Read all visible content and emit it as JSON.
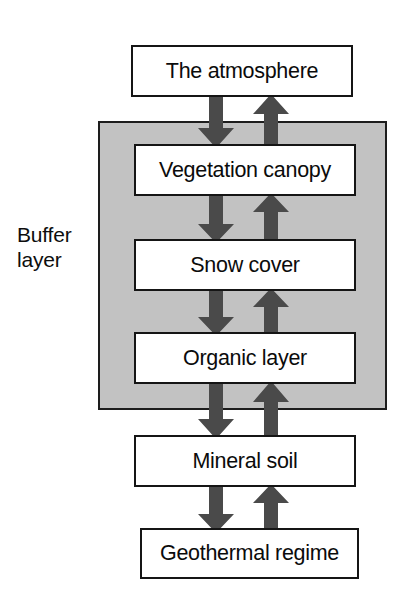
{
  "diagram": {
    "background_color": "#ffffff",
    "buffer_region": {
      "label_line1": "Buffer",
      "label_line2": "layer",
      "fill_color": "#c2c2c2",
      "border_color": "#1d1d1d"
    },
    "box_style": {
      "fill_color": "#ffffff",
      "border_color": "#151515"
    },
    "arrow_color": "#4a4a4a",
    "nodes": [
      {
        "id": "atmosphere",
        "label": "The atmosphere",
        "inside_buffer": false
      },
      {
        "id": "vegetation",
        "label": "Vegetation canopy",
        "inside_buffer": true
      },
      {
        "id": "snow",
        "label": "Snow cover",
        "inside_buffer": true
      },
      {
        "id": "organic",
        "label": "Organic layer",
        "inside_buffer": true
      },
      {
        "id": "mineral",
        "label": "Mineral soil",
        "inside_buffer": false
      },
      {
        "id": "geothermal",
        "label": "Geothermal regime",
        "inside_buffer": false
      }
    ],
    "connections": [
      {
        "from": "atmosphere",
        "to": "vegetation",
        "direction": "down"
      },
      {
        "from": "vegetation",
        "to": "atmosphere",
        "direction": "up"
      },
      {
        "from": "vegetation",
        "to": "snow",
        "direction": "down"
      },
      {
        "from": "snow",
        "to": "vegetation",
        "direction": "up"
      },
      {
        "from": "snow",
        "to": "organic",
        "direction": "down"
      },
      {
        "from": "organic",
        "to": "snow",
        "direction": "up"
      },
      {
        "from": "organic",
        "to": "mineral",
        "direction": "down"
      },
      {
        "from": "mineral",
        "to": "organic",
        "direction": "up"
      },
      {
        "from": "mineral",
        "to": "geothermal",
        "direction": "down"
      },
      {
        "from": "geothermal",
        "to": "mineral",
        "direction": "up"
      }
    ]
  }
}
